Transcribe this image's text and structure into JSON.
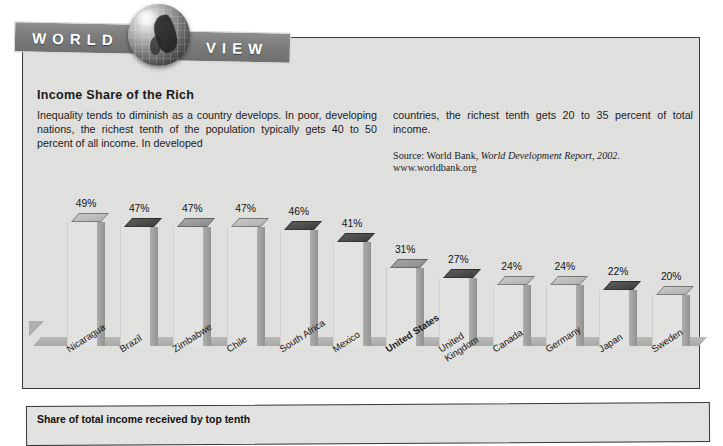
{
  "banner": {
    "word_left": "WORLD",
    "word_right": "VIEW",
    "globe_icon": "globe-icon"
  },
  "article": {
    "headline": "Income Share of the Rich",
    "body_left": "Inequality tends to diminish as a country develops. In poor, developing nations, the richest tenth of the population typically gets 40 to 50 percent of all income. In developed",
    "body_right": "countries, the richest tenth gets 20 to 35 percent of total income.",
    "source_prefix": "Source: World Bank, ",
    "source_title": "World Development Report, 2002.",
    "source_url": "www.worldbank.org"
  },
  "chart_data": {
    "type": "bar",
    "title": "Income Share of the Rich",
    "xlabel": "",
    "ylabel": "",
    "ylim": [
      0,
      50
    ],
    "grid": false,
    "legend": null,
    "value_suffix": "%",
    "axis_caption": "Share of total income received by top tenth",
    "highlight": "United States",
    "categories": [
      "Nicaragua",
      "Brazil",
      "Zimbabwe",
      "Chile",
      "South Africa",
      "Mexico",
      "United States",
      "United Kingdom",
      "Canada",
      "Germany",
      "Japan",
      "Sweden"
    ],
    "values": [
      49,
      47,
      47,
      47,
      46,
      41,
      31,
      27,
      24,
      24,
      22,
      20
    ],
    "labels": [
      "49%",
      "47%",
      "47%",
      "47%",
      "46%",
      "41%",
      "31%",
      "27%",
      "24%",
      "24%",
      "22%",
      "20%"
    ],
    "top_shades": [
      "light",
      "dark",
      "medium",
      "light",
      "dark",
      "dark",
      "medium",
      "dark",
      "light",
      "light",
      "dark",
      "light"
    ],
    "colors": {
      "paper": "#e2e2e0",
      "bar_side": "#9d9d9b",
      "top_light": "#c0c0be",
      "top_medium": "#9a9a98",
      "top_dark": "#4b4b49",
      "floor": "#b0b0ae",
      "banner": "#7d7d7d",
      "text": "#1a1a1a"
    }
  }
}
